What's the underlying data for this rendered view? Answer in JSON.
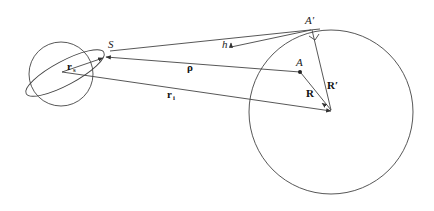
{
  "diagram": {
    "labels": {
      "S": "S",
      "A_prime": "A′",
      "A": "A",
      "h": "h",
      "rho": "ρ",
      "r_s_base": "r",
      "r_s_sub": "s",
      "r_i_base": "r",
      "r_i_sub": "i",
      "R_prime": "R′",
      "R": "R"
    },
    "colors": {
      "stroke": "#444444",
      "text": "#222222",
      "background": "#ffffff"
    }
  }
}
